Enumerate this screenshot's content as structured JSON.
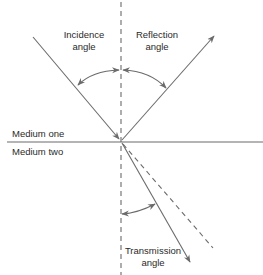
{
  "diagram": {
    "title": "",
    "colors": {
      "line": "#6b6b6b",
      "text": "#2a2a2a",
      "background": "#ffffff"
    },
    "labels": {
      "incidence": [
        "Incidence",
        "angle"
      ],
      "reflection": [
        "Reflection",
        "angle"
      ],
      "transmission": [
        "Transmission",
        "angle"
      ],
      "medium_one": "Medium one",
      "medium_two": "Medium two"
    },
    "elements": [
      {
        "id": "normal-line",
        "type": "dashed-line",
        "from": [
          121,
          0
        ],
        "to": [
          121,
          275
        ]
      },
      {
        "id": "interface-line",
        "type": "line",
        "from": [
          7,
          142
        ],
        "to": [
          263,
          142
        ]
      },
      {
        "id": "incident-ray",
        "type": "arrow",
        "from": [
          33,
          37
        ],
        "to": [
          120,
          140
        ]
      },
      {
        "id": "reflected-ray",
        "type": "arrow",
        "from": [
          122,
          140
        ],
        "to": [
          214,
          36
        ]
      },
      {
        "id": "transmitted-ray",
        "type": "arrow",
        "from": [
          122,
          143
        ],
        "to": [
          190,
          262
        ]
      },
      {
        "id": "extended-incident-ray",
        "type": "dashed-line",
        "from": [
          122,
          143
        ],
        "to": [
          213,
          248
        ]
      },
      {
        "id": "incidence-angle-arc",
        "type": "double-arrow-arc"
      },
      {
        "id": "reflection-angle-arc",
        "type": "double-arrow-arc"
      },
      {
        "id": "transmission-angle-arc",
        "type": "double-arrow-arc"
      }
    ]
  }
}
